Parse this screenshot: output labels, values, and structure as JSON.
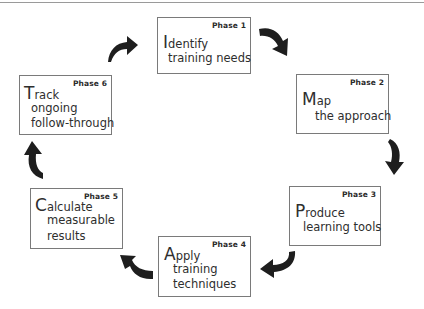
{
  "diagram": {
    "type": "cycle",
    "direction": "clockwise",
    "phases": [
      {
        "phase_label": "Phase 1",
        "initial": "I",
        "first_word_rest": "dentify",
        "lines": [
          "training needs"
        ]
      },
      {
        "phase_label": "Phase 2",
        "initial": "M",
        "first_word_rest": "ap",
        "lines": [
          "the approach"
        ]
      },
      {
        "phase_label": "Phase 3",
        "initial": "P",
        "first_word_rest": "roduce",
        "lines": [
          "learning tools"
        ]
      },
      {
        "phase_label": "Phase 4",
        "initial": "A",
        "first_word_rest": "pply",
        "lines": [
          "training",
          "techniques"
        ]
      },
      {
        "phase_label": "Phase 5",
        "initial": "C",
        "first_word_rest": "alculate",
        "lines": [
          "measurable",
          "results"
        ]
      },
      {
        "phase_label": "Phase 6",
        "initial": "T",
        "first_word_rest": "rack",
        "lines": [
          "ongoing",
          "follow-through"
        ]
      }
    ],
    "arrows": [
      {
        "from": "Phase 1",
        "to": "Phase 2",
        "icon": "curved-arrow-down-right"
      },
      {
        "from": "Phase 2",
        "to": "Phase 3",
        "icon": "curved-arrow-down"
      },
      {
        "from": "Phase 3",
        "to": "Phase 4",
        "icon": "curved-arrow-down-left"
      },
      {
        "from": "Phase 4",
        "to": "Phase 5",
        "icon": "curved-arrow-up-left"
      },
      {
        "from": "Phase 5",
        "to": "Phase 6",
        "icon": "curved-arrow-up"
      },
      {
        "from": "Phase 6",
        "to": "Phase 1",
        "icon": "curved-arrow-up-right"
      }
    ]
  },
  "colors": {
    "text": "#2e2e2e",
    "box_border": "#7a7a7a",
    "arrow": "#1e1e1e",
    "background": "#ffffff"
  }
}
